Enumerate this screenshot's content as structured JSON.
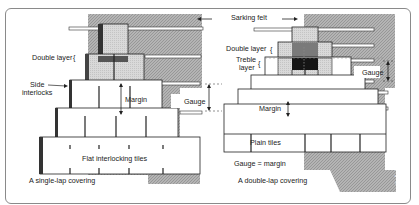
{
  "diagram": {
    "left_panel": {
      "caption": "A single-lap covering",
      "labels": {
        "double_layer": "Double layer",
        "side_interlocks_line1": "Side",
        "side_interlocks_line2": "interlocks",
        "margin": "Margin",
        "gauge": "Gauge",
        "tiles": "Flat interlocking tiles"
      }
    },
    "right_panel": {
      "caption": "A double-lap covering",
      "labels": {
        "sarking_felt": "Sarking felt",
        "double_layer": "Double layer",
        "treble_layer_line1": "Treble",
        "treble_layer_line2": "layer",
        "gauge": "Gauge",
        "margin": "Margin",
        "tiles": "Plain tiles",
        "equation": "Gauge = margin"
      }
    },
    "credit": "© John Wickesham",
    "colors": {
      "hatch": "#a9a9a9",
      "tile": "#ffffff",
      "tile_stroke": "#222222",
      "light_gray": "#d8d8d8",
      "mid_gray": "#7a7a7a",
      "dark": "#151515"
    }
  }
}
